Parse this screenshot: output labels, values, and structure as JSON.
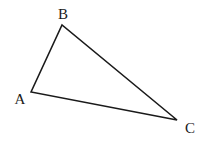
{
  "diagram": {
    "type": "triangle",
    "stroke_color": "#1a1a1a",
    "background": "#ffffff",
    "vertices": [
      {
        "label": "A",
        "x": 31,
        "y": 92,
        "label_x": 20,
        "label_y": 104
      },
      {
        "label": "B",
        "x": 62,
        "y": 25,
        "label_x": 63,
        "label_y": 19
      },
      {
        "label": "C",
        "x": 177,
        "y": 120,
        "label_x": 190,
        "label_y": 133
      }
    ],
    "edges": [
      [
        "A",
        "B"
      ],
      [
        "B",
        "C"
      ],
      [
        "C",
        "A"
      ]
    ]
  }
}
